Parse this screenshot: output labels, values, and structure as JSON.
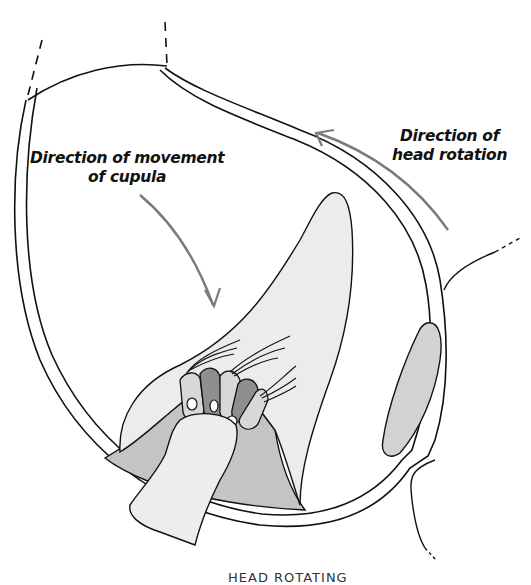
{
  "diagram": {
    "type": "anatomical illustration",
    "labels": {
      "cupula_movement_line1": "Direction of movement",
      "cupula_movement_line2": "of cupula",
      "head_rotation_line1": "Direction of",
      "head_rotation_line2": "head rotation"
    },
    "caption": "HEAD ROTATING",
    "colors": {
      "outline": "#111111",
      "canal_wall_fill": "#ffffff",
      "endolymph": "#ffffff",
      "cupula_fill": "#ececec",
      "crista_fill": "#c4c4c4",
      "nerve_fill": "#ededed",
      "hair_cell_light": "#d8d8d8",
      "hair_cell_dark": "#8f8f8f",
      "side_organ_fill": "#d2d2d2",
      "arrow": "#7a7a7a"
    }
  }
}
